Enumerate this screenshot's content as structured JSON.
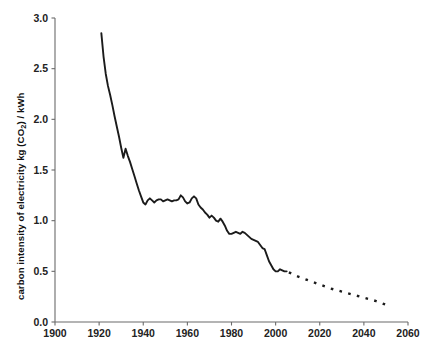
{
  "chart_data": {
    "type": "line",
    "title": "",
    "subtitle": "",
    "xlabel": "",
    "ylabel": "carbon intensity of electricity kg (CO2) / kWh",
    "ylabel_parts": {
      "before": "carbon intensity of electricity kg (CO",
      "subscript": "2",
      "after": ") / kWh"
    },
    "xlim": [
      1900,
      2060
    ],
    "ylim": [
      0.0,
      3.0
    ],
    "grid": false,
    "legend": false,
    "legend_position": "none",
    "xticks": [
      1900,
      1920,
      1940,
      1960,
      1980,
      2000,
      2020,
      2040,
      2060
    ],
    "xtick_labels": [
      "1900",
      "1920",
      "1940",
      "1960",
      "1980",
      "2000",
      "2020",
      "2040",
      "2060"
    ],
    "yticks": [
      0.0,
      0.5,
      1.0,
      1.5,
      2.0,
      2.5,
      3.0
    ],
    "ytick_labels": [
      "0.0",
      "0.5",
      "1.0",
      "1.5",
      "2.0",
      "2.5",
      "3.0"
    ],
    "colors": {
      "line": "#1b1b1b",
      "axis": "#6b6b6b",
      "text": "#111111",
      "background": "#ffffff"
    },
    "series": [
      {
        "name": "historical carbon intensity",
        "style": "solid",
        "x": [
          1921,
          1922,
          1923,
          1924,
          1925,
          1926,
          1927,
          1928,
          1929,
          1930,
          1931,
          1932,
          1933,
          1934,
          1935,
          1936,
          1937,
          1938,
          1939,
          1940,
          1941,
          1942,
          1943,
          1944,
          1945,
          1946,
          1947,
          1948,
          1949,
          1950,
          1951,
          1952,
          1953,
          1954,
          1955,
          1956,
          1957,
          1958,
          1959,
          1960,
          1961,
          1962,
          1963,
          1964,
          1965,
          1966,
          1967,
          1968,
          1969,
          1970,
          1971,
          1972,
          1973,
          1974,
          1975,
          1976,
          1977,
          1978,
          1979,
          1980,
          1981,
          1982,
          1983,
          1984,
          1985,
          1986,
          1987,
          1988,
          1989,
          1990,
          1991,
          1992,
          1993,
          1994,
          1995,
          1996,
          1997,
          1998,
          1999,
          2000,
          2001,
          2002,
          2003,
          2004,
          2005
        ],
        "y": [
          2.85,
          2.62,
          2.45,
          2.33,
          2.24,
          2.14,
          2.03,
          1.93,
          1.83,
          1.72,
          1.62,
          1.71,
          1.64,
          1.58,
          1.51,
          1.44,
          1.37,
          1.3,
          1.24,
          1.18,
          1.16,
          1.2,
          1.22,
          1.2,
          1.18,
          1.2,
          1.21,
          1.21,
          1.19,
          1.2,
          1.21,
          1.2,
          1.19,
          1.2,
          1.2,
          1.21,
          1.25,
          1.23,
          1.19,
          1.17,
          1.18,
          1.22,
          1.24,
          1.22,
          1.16,
          1.13,
          1.11,
          1.08,
          1.06,
          1.03,
          1.05,
          1.03,
          1.0,
          0.99,
          1.02,
          0.99,
          0.95,
          0.9,
          0.87,
          0.87,
          0.88,
          0.89,
          0.88,
          0.87,
          0.89,
          0.88,
          0.86,
          0.84,
          0.82,
          0.81,
          0.8,
          0.79,
          0.76,
          0.73,
          0.72,
          0.66,
          0.6,
          0.56,
          0.52,
          0.5,
          0.5,
          0.52,
          0.51,
          0.5,
          0.5
        ]
      },
      {
        "name": "projected carbon intensity",
        "style": "dotted",
        "x": [
          2006,
          2010,
          2015,
          2020,
          2025,
          2030,
          2035,
          2040,
          2045,
          2050
        ],
        "y": [
          0.49,
          0.45,
          0.41,
          0.37,
          0.33,
          0.3,
          0.27,
          0.24,
          0.21,
          0.17
        ]
      }
    ],
    "annotations": []
  },
  "figure": {
    "plot_left_px": 55,
    "plot_right_px": 408,
    "plot_top_px": 18,
    "plot_bottom_px": 322
  }
}
